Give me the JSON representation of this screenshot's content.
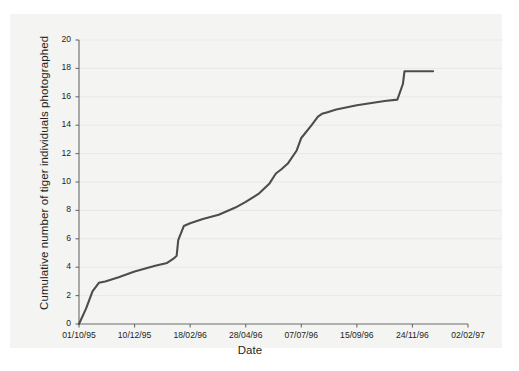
{
  "chart_data": {
    "type": "line",
    "title": "",
    "xlabel": "Date",
    "ylabel": "Cumulative number of tiger individuals photographed",
    "ylim": [
      0,
      20
    ],
    "yticks": [
      0,
      2,
      4,
      6,
      8,
      10,
      12,
      14,
      16,
      18,
      20
    ],
    "xticks": [
      "01/10/95",
      "10/12/95",
      "18/02/96",
      "28/04/96",
      "07/07/96",
      "15/09/96",
      "24/11/96",
      "02/02/97"
    ],
    "grid": "horizontal",
    "legend": "none",
    "series": [
      {
        "name": "Cumulative tiger individuals photographed",
        "color": "#4d4d4d",
        "x": [
          "01/10/95",
          "10/10/95",
          "18/10/95",
          "26/10/95",
          "03/11/95",
          "20/11/95",
          "10/12/95",
          "05/01/96",
          "20/01/96",
          "28/01/96",
          "01/02/96",
          "03/02/96",
          "10/02/96",
          "18/02/96",
          "05/03/96",
          "25/03/96",
          "15/04/96",
          "28/04/96",
          "15/05/96",
          "28/05/96",
          "05/06/96",
          "12/06/96",
          "20/06/96",
          "01/07/96",
          "07/07/96",
          "20/07/96",
          "28/07/96",
          "02/08/96",
          "08/08/96",
          "20/08/96",
          "15/09/96",
          "20/10/96",
          "05/11/96",
          "12/11/96",
          "14/11/96",
          "24/11/96",
          "20/12/96"
        ],
        "y": [
          0,
          1.1,
          2.3,
          2.9,
          3.0,
          3.3,
          3.7,
          4.1,
          4.3,
          4.6,
          4.8,
          5.9,
          6.9,
          7.1,
          7.4,
          7.7,
          8.2,
          8.6,
          9.2,
          9.9,
          10.6,
          10.9,
          11.3,
          12.2,
          13.1,
          14.0,
          14.6,
          14.8,
          14.9,
          15.1,
          15.4,
          15.7,
          15.8,
          16.9,
          17.8,
          17.8,
          17.8
        ]
      }
    ]
  },
  "figure": {
    "xlabel": "Date",
    "ylabel": "Cumulative number of tiger individuals photographed",
    "yticks": [
      "0",
      "2",
      "4",
      "6",
      "8",
      "10",
      "12",
      "14",
      "16",
      "18",
      "20"
    ],
    "xticks": [
      "01/10/95",
      "10/12/95",
      "18/02/96",
      "28/04/96",
      "07/07/96",
      "15/09/96",
      "24/11/96",
      "02/02/97"
    ],
    "colors": {
      "line": "#4d4d4d",
      "axis": "#6b6b6b",
      "grid": "#e8e8e6",
      "panel": "#f4f4f2",
      "text": "#231f20"
    }
  }
}
